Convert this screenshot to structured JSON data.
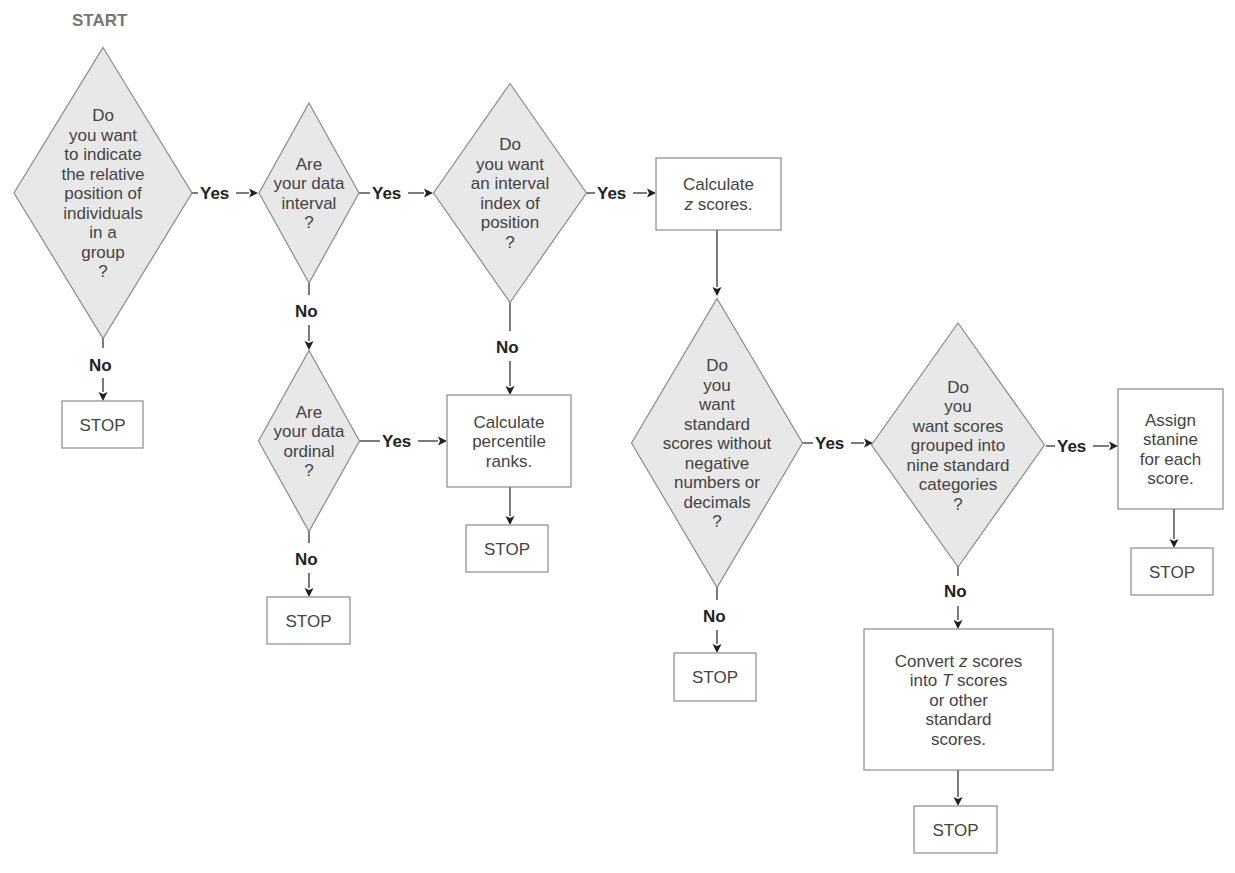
{
  "diagram": {
    "start_label": "START",
    "colors": {
      "diamond_fill": "#e8e8e8",
      "shape_stroke": "#8a8a8a",
      "text": "#444444",
      "label": "#222222",
      "start": "#777777"
    },
    "nodes": [
      {
        "id": "q-relative-position",
        "type": "decision",
        "cx": 103,
        "cy": 193,
        "w": 178,
        "h": 291,
        "lines": [
          "Do",
          "you want",
          "to indicate",
          "the relative",
          "position of",
          "individuals",
          "in a",
          "group",
          "?"
        ]
      },
      {
        "id": "q-interval",
        "type": "decision",
        "cx": 309,
        "cy": 193,
        "w": 100,
        "h": 180,
        "lines": [
          "Are",
          "your data",
          "interval",
          "?"
        ]
      },
      {
        "id": "q-interval-index",
        "type": "decision",
        "cx": 510,
        "cy": 193,
        "w": 153,
        "h": 219,
        "lines": [
          "Do",
          "you want",
          "an interval",
          "index of",
          "position",
          "?"
        ]
      },
      {
        "id": "calc-z",
        "type": "process",
        "x": 656,
        "y": 158,
        "w": 125,
        "h": 72,
        "lines": [
          "Calculate",
          "z scores."
        ],
        "italic_first_word_line": 1
      },
      {
        "id": "stop-1",
        "type": "terminal",
        "x": 62,
        "y": 401,
        "w": 81,
        "h": 47,
        "lines": [
          "STOP"
        ]
      },
      {
        "id": "q-ordinal",
        "type": "decision",
        "cx": 309,
        "cy": 441,
        "w": 101,
        "h": 181,
        "lines": [
          "Are",
          "your data",
          "ordinal",
          "?"
        ]
      },
      {
        "id": "calc-percentile",
        "type": "process",
        "x": 447,
        "y": 395,
        "w": 124,
        "h": 92,
        "lines": [
          "Calculate",
          "percentile",
          "ranks."
        ]
      },
      {
        "id": "stop-2",
        "type": "terminal",
        "x": 466,
        "y": 525,
        "w": 82,
        "h": 47,
        "lines": [
          "STOP"
        ]
      },
      {
        "id": "stop-3",
        "type": "terminal",
        "x": 267,
        "y": 597,
        "w": 83,
        "h": 47,
        "lines": [
          "STOP"
        ]
      },
      {
        "id": "q-standard-scores",
        "type": "decision",
        "cx": 717,
        "cy": 443,
        "w": 171,
        "h": 289,
        "lines": [
          "Do",
          "you",
          "want",
          "standard",
          "scores without",
          "negative",
          "numbers or",
          "decimals",
          "?"
        ]
      },
      {
        "id": "stop-4",
        "type": "terminal",
        "x": 674,
        "y": 653,
        "w": 82,
        "h": 48,
        "lines": [
          "STOP"
        ]
      },
      {
        "id": "q-nine-categories",
        "type": "decision",
        "cx": 958,
        "cy": 445,
        "w": 173,
        "h": 244,
        "lines": [
          "Do",
          "you",
          "want scores",
          "grouped into",
          "nine standard",
          "categories",
          "?"
        ]
      },
      {
        "id": "assign-stanine",
        "type": "process",
        "x": 1118,
        "y": 389,
        "w": 105,
        "h": 120,
        "lines": [
          "Assign",
          "stanine",
          "for each",
          "score."
        ]
      },
      {
        "id": "stop-5",
        "type": "terminal",
        "x": 1131,
        "y": 548,
        "w": 82,
        "h": 47,
        "lines": [
          "STOP"
        ]
      },
      {
        "id": "convert-t",
        "type": "process",
        "x": 864,
        "y": 629,
        "w": 189,
        "h": 141,
        "lines": [
          "Convert z scores",
          "into T scores",
          "or other",
          "standard",
          "scores."
        ]
      },
      {
        "id": "stop-6",
        "type": "terminal",
        "x": 914,
        "y": 806,
        "w": 83,
        "h": 47,
        "lines": [
          "STOP"
        ]
      }
    ],
    "edges": [
      {
        "from": "q-relative-position",
        "to": "q-interval",
        "label": "Yes",
        "dir": "h",
        "x1": 192,
        "y1": 193,
        "x2": 258,
        "y2": 193,
        "lx": 200,
        "ly": 199
      },
      {
        "from": "q-relative-position",
        "to": "stop-1",
        "label": "No",
        "dir": "v",
        "x1": 103,
        "y1": 335,
        "x2": 103,
        "y2": 401,
        "lx": 89,
        "ly": 371,
        "gap": [
          348,
          378
        ]
      },
      {
        "from": "q-interval",
        "to": "q-interval-index",
        "label": "Yes",
        "dir": "h",
        "x1": 359,
        "y1": 193,
        "x2": 433,
        "y2": 193,
        "lx": 372,
        "ly": 199
      },
      {
        "from": "q-interval",
        "to": "q-ordinal",
        "label": "No",
        "dir": "v",
        "x1": 309,
        "y1": 283,
        "x2": 309,
        "y2": 350,
        "lx": 295,
        "ly": 317,
        "gap": [
          295,
          325
        ]
      },
      {
        "from": "q-interval-index",
        "to": "calc-z",
        "label": "Yes",
        "dir": "h",
        "x1": 586,
        "y1": 193,
        "x2": 656,
        "y2": 193,
        "lx": 597,
        "ly": 199
      },
      {
        "from": "q-interval-index",
        "to": "calc-percentile",
        "label": "No",
        "dir": "v",
        "x1": 510,
        "y1": 302,
        "x2": 510,
        "y2": 395,
        "lx": 496,
        "ly": 353,
        "gap": [
          331,
          361
        ]
      },
      {
        "from": "calc-z",
        "to": "q-standard-scores",
        "label": "",
        "dir": "v",
        "x1": 717,
        "y1": 230,
        "x2": 717,
        "y2": 296
      },
      {
        "from": "q-ordinal",
        "to": "calc-percentile",
        "label": "Yes",
        "dir": "h",
        "x1": 359,
        "y1": 441,
        "x2": 447,
        "y2": 441,
        "lx": 382,
        "ly": 447,
        "gap": [
          378,
          418
        ]
      },
      {
        "from": "calc-percentile",
        "to": "stop-2",
        "label": "",
        "dir": "v",
        "x1": 510,
        "y1": 487,
        "x2": 510,
        "y2": 525
      },
      {
        "from": "q-ordinal",
        "to": "stop-3",
        "label": "No",
        "dir": "v",
        "x1": 309,
        "y1": 530,
        "x2": 309,
        "y2": 597,
        "lx": 295,
        "ly": 565,
        "gap": [
          543,
          573
        ]
      },
      {
        "from": "q-standard-scores",
        "to": "q-nine-categories",
        "label": "Yes",
        "dir": "h",
        "x1": 802,
        "y1": 443,
        "x2": 873,
        "y2": 443,
        "lx": 815,
        "ly": 449
      },
      {
        "from": "q-standard-scores",
        "to": "stop-4",
        "label": "No",
        "dir": "v",
        "x1": 717,
        "y1": 585,
        "x2": 717,
        "y2": 653,
        "lx": 703,
        "ly": 622,
        "gap": [
          600,
          630
        ]
      },
      {
        "from": "q-nine-categories",
        "to": "assign-stanine",
        "label": "Yes",
        "dir": "h",
        "x1": 1046,
        "y1": 446,
        "x2": 1118,
        "y2": 446,
        "lx": 1057,
        "ly": 452
      },
      {
        "from": "assign-stanine",
        "to": "stop-5",
        "label": "",
        "dir": "v",
        "x1": 1174,
        "y1": 509,
        "x2": 1174,
        "y2": 548
      },
      {
        "from": "q-nine-categories",
        "to": "convert-t",
        "label": "No",
        "dir": "v",
        "x1": 958,
        "y1": 565,
        "x2": 958,
        "y2": 629,
        "lx": 944,
        "ly": 597,
        "gap": [
          576,
          606
        ]
      },
      {
        "from": "convert-t",
        "to": "stop-6",
        "label": "",
        "dir": "v",
        "x1": 958,
        "y1": 770,
        "x2": 958,
        "y2": 806
      }
    ]
  }
}
